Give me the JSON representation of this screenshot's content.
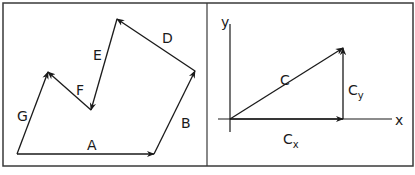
{
  "left_panel": {
    "title": "Vector polygon (head-to-tail addition)",
    "vectors": [
      {
        "name": "A",
        "from": [
          17,
          154
        ],
        "to": [
          154,
          154
        ],
        "label_pos": [
          87,
          150
        ]
      },
      {
        "name": "B",
        "from": [
          154,
          154
        ],
        "to": [
          195,
          71
        ],
        "label_pos": [
          181,
          128
        ]
      },
      {
        "name": "D",
        "from": [
          195,
          71
        ],
        "to": [
          117,
          19
        ],
        "label_pos": [
          162,
          43
        ]
      },
      {
        "name": "E",
        "from": [
          117,
          19
        ],
        "to": [
          91,
          110
        ],
        "label_pos": [
          93,
          60
        ]
      },
      {
        "name": "F",
        "from": [
          91,
          110
        ],
        "to": [
          48,
          72
        ],
        "label_pos": [
          76,
          95
        ]
      },
      {
        "name": "G",
        "from": [
          17,
          154
        ],
        "to": [
          48,
          72
        ],
        "label_pos": [
          17,
          121
        ]
      }
    ]
  },
  "right_panel": {
    "title": "Vector components",
    "axes": {
      "x_label": "x",
      "y_label": "y"
    },
    "vectors": [
      {
        "name": "C",
        "label": "C",
        "from": [
          230,
          119
        ],
        "to": [
          343,
          48
        ],
        "label_pos": [
          280,
          85
        ]
      },
      {
        "name": "Cx",
        "label": "C",
        "sub": "x",
        "from": [
          230,
          119
        ],
        "to": [
          343,
          119
        ],
        "label_pos": [
          283,
          144
        ]
      },
      {
        "name": "Cy",
        "label": "C",
        "sub": "y",
        "from": [
          343,
          119
        ],
        "to": [
          343,
          48
        ],
        "label_pos": [
          348,
          95
        ]
      }
    ]
  },
  "colors": {
    "ink": "#1a1a1a",
    "border": "#3a3a3a",
    "background": "#ffffff"
  }
}
